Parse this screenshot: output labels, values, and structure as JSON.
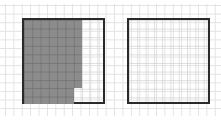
{
  "figure": {
    "grid_size": [
      10,
      10
    ],
    "left_square": {
      "shaded_cells": 68,
      "total_cells": 100,
      "shaded_regions": [
        {
          "columns": 7,
          "rows": 8,
          "position": "top-left"
        },
        {
          "columns": 6,
          "rows": 2,
          "position": "bottom-left"
        }
      ],
      "shade_color": "#8c8c8c"
    },
    "right_square": {
      "shaded_cells": 0,
      "total_cells": 100
    },
    "border_color": "#2a2a2a",
    "gridline_color": "#e2e2e2"
  }
}
